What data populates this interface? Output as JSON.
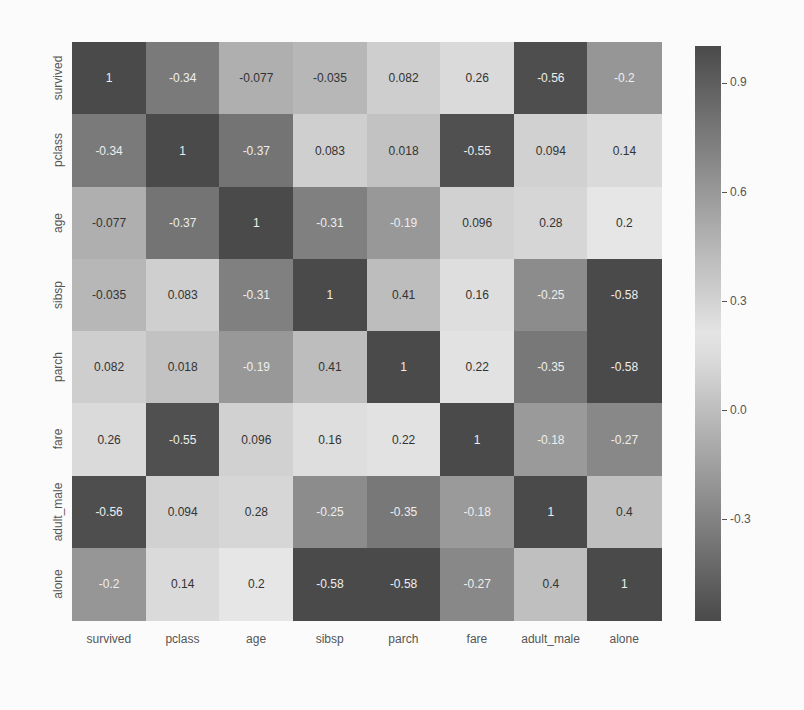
{
  "chart_data": {
    "type": "heatmap",
    "title": "",
    "xlabel": "",
    "ylabel": "",
    "variables": [
      "survived",
      "pclass",
      "age",
      "sibsp",
      "parch",
      "fare",
      "adult_male",
      "alone"
    ],
    "x_tick_labels": [
      "survived",
      "pclass",
      "age",
      "sibsp",
      "parch",
      "fare",
      "adult_male",
      "alone"
    ],
    "y_tick_labels": [
      "survived",
      "pclass",
      "age",
      "sibsp",
      "parch",
      "fare",
      "adult_male",
      "alone"
    ],
    "values": [
      [
        1,
        -0.34,
        -0.077,
        -0.035,
        0.082,
        0.26,
        -0.56,
        -0.2
      ],
      [
        -0.34,
        1,
        -0.37,
        0.083,
        0.018,
        -0.55,
        0.094,
        0.14
      ],
      [
        -0.077,
        -0.37,
        1,
        -0.31,
        -0.19,
        0.096,
        0.28,
        0.2
      ],
      [
        -0.035,
        0.083,
        -0.31,
        1,
        0.41,
        0.16,
        -0.25,
        -0.58
      ],
      [
        0.082,
        0.018,
        -0.19,
        0.41,
        1,
        0.22,
        -0.35,
        -0.58
      ],
      [
        0.26,
        -0.55,
        0.096,
        0.16,
        0.22,
        1,
        -0.18,
        -0.27
      ],
      [
        -0.56,
        0.094,
        0.28,
        -0.25,
        -0.35,
        -0.18,
        1,
        0.4
      ],
      [
        -0.2,
        0.14,
        0.2,
        -0.58,
        -0.58,
        -0.27,
        0.4,
        1
      ]
    ],
    "annotations": [
      [
        "1",
        "-0.34",
        "-0.077",
        "-0.035",
        "0.082",
        "0.26",
        "-0.56",
        "-0.2"
      ],
      [
        "-0.34",
        "1",
        "-0.37",
        "0.083",
        "0.018",
        "-0.55",
        "0.094",
        "0.14"
      ],
      [
        "-0.077",
        "-0.37",
        "1",
        "-0.31",
        "-0.19",
        "0.096",
        "0.28",
        "0.2"
      ],
      [
        "-0.035",
        "0.083",
        "-0.31",
        "1",
        "0.41",
        "0.16",
        "-0.25",
        "-0.58"
      ],
      [
        "0.082",
        "0.018",
        "-0.19",
        "0.41",
        "1",
        "0.22",
        "-0.35",
        "-0.58"
      ],
      [
        "0.26",
        "-0.55",
        "0.096",
        "0.16",
        "0.22",
        "1",
        "-0.18",
        "-0.27"
      ],
      [
        "-0.56",
        "0.094",
        "0.28",
        "-0.25",
        "-0.35",
        "-0.18",
        "1",
        "0.4"
      ],
      [
        "-0.2",
        "0.14",
        "0.2",
        "-0.58",
        "-0.58",
        "-0.27",
        "0.4",
        "1"
      ]
    ],
    "colorbar": {
      "ticks": [
        0.9,
        0.6,
        0.3,
        0.0,
        -0.3
      ],
      "tick_labels": [
        "0.9",
        "0.6",
        "0.3",
        "0.0",
        "-0.3"
      ],
      "vmin": -0.58,
      "vmax": 1.0,
      "center": 0.2,
      "colormap": "diverging grayscale (dark at extremes, light near center)"
    },
    "grid": false,
    "legend_position": "right (colorbar)"
  },
  "colors": {
    "dark": "#4a4a4a",
    "light": "#e6e6e6",
    "background": "#fbfbfb",
    "dark_text": "#eeeeee",
    "light_text": "#333333"
  }
}
